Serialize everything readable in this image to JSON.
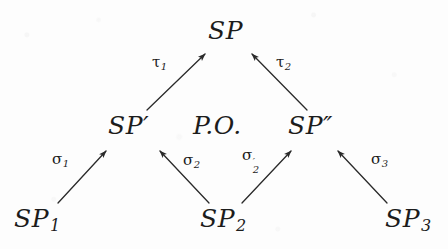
{
  "diagram": {
    "type": "commutative-diagram",
    "background_color": "#fdfdfd",
    "ink_color": "#1c1c1c",
    "center_label": "P.O.",
    "nodes": [
      {
        "id": "SP",
        "base": "SP",
        "prime": "",
        "sub": "",
        "x": 208,
        "y": 18
      },
      {
        "id": "SP1",
        "base": "SP",
        "prime": "",
        "sub": "1",
        "x": 14,
        "y": 206
      },
      {
        "id": "SP2",
        "base": "SP",
        "prime": "",
        "sub": "2",
        "x": 200,
        "y": 206
      },
      {
        "id": "SP3",
        "base": "SP",
        "prime": "",
        "sub": "3",
        "x": 385,
        "y": 206
      },
      {
        "id": "SPp",
        "base": "SP",
        "prime": "′",
        "sub": "",
        "x": 108,
        "y": 113
      },
      {
        "id": "SPpp",
        "base": "SP",
        "prime": "″",
        "sub": "",
        "x": 288,
        "y": 113
      }
    ],
    "arrows": [
      {
        "id": "sigma1",
        "label_base": "σ",
        "label_sub": "1",
        "label_prime": "",
        "from": "SP1",
        "to": "SPp",
        "x1": 58,
        "y1": 203,
        "x2": 106,
        "y2": 151,
        "label_x": 52,
        "label_y": 152
      },
      {
        "id": "sigma2",
        "label_base": "σ",
        "label_sub": "2",
        "label_prime": "",
        "from": "SP2",
        "to": "SPp",
        "x1": 209,
        "y1": 203,
        "x2": 160,
        "y2": 151,
        "label_x": 183,
        "label_y": 153
      },
      {
        "id": "sigma2prime",
        "label_base": "σ",
        "label_sub": "2",
        "label_prime": "′",
        "from": "SP2",
        "to": "SPpp",
        "x1": 242,
        "y1": 203,
        "x2": 291,
        "y2": 151,
        "label_x": 242,
        "label_y": 148
      },
      {
        "id": "sigma3",
        "label_base": "σ",
        "label_sub": "3",
        "label_prime": "",
        "from": "SP3",
        "to": "SPpp",
        "x1": 387,
        "y1": 203,
        "x2": 338,
        "y2": 151,
        "label_x": 371,
        "label_y": 152
      },
      {
        "id": "tau1",
        "label_base": "τ",
        "label_sub": "1",
        "label_prime": "",
        "from": "SPp",
        "to": "SP",
        "x1": 147,
        "y1": 110,
        "x2": 205,
        "y2": 54,
        "label_x": 152,
        "label_y": 55
      },
      {
        "id": "tau2",
        "label_base": "τ",
        "label_sub": "2",
        "label_prime": "",
        "from": "SPpp",
        "to": "SP",
        "x1": 307,
        "y1": 110,
        "x2": 252,
        "y2": 54,
        "label_x": 276,
        "label_y": 55
      }
    ]
  }
}
